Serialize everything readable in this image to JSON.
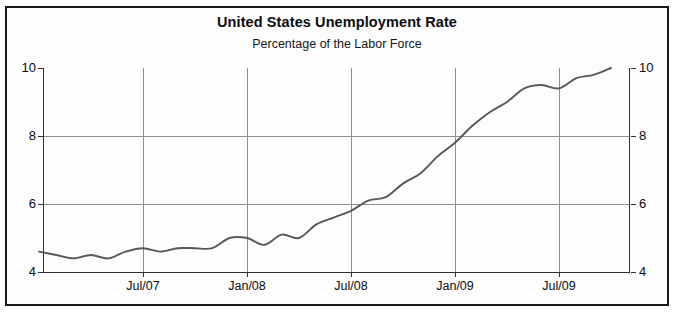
{
  "chart_data": {
    "type": "line",
    "title": "United States Unemployment Rate",
    "subtitle": "Percentage of the Labor Force",
    "xlabel": "",
    "ylabel": "",
    "ylim": [
      4,
      10
    ],
    "yticks": [
      4,
      6,
      8,
      10
    ],
    "ytick_labels": [
      "4",
      "6",
      "8",
      "10"
    ],
    "xtick_labels": [
      "Jul/07",
      "Jan/08",
      "Jul/08",
      "Jan/09",
      "Jul/09"
    ],
    "xlim_labels": [
      "Jan/07",
      "Oct/09"
    ],
    "grid": true,
    "legend": "none",
    "line_color": "#55585c",
    "series": [
      {
        "name": "Unemployment Rate",
        "x": [
          "Jan/07",
          "Feb/07",
          "Mar/07",
          "Apr/07",
          "May/07",
          "Jun/07",
          "Jul/07",
          "Aug/07",
          "Sep/07",
          "Oct/07",
          "Nov/07",
          "Dec/07",
          "Jan/08",
          "Feb/08",
          "Mar/08",
          "Apr/08",
          "May/08",
          "Jun/08",
          "Jul/08",
          "Aug/08",
          "Sep/08",
          "Oct/08",
          "Nov/08",
          "Dec/08",
          "Jan/09",
          "Feb/09",
          "Mar/09",
          "Apr/09",
          "May/09",
          "Jun/09",
          "Jul/09",
          "Aug/09",
          "Sep/09",
          "Oct/09"
        ],
        "values": [
          4.6,
          4.5,
          4.4,
          4.5,
          4.4,
          4.6,
          4.7,
          4.6,
          4.7,
          4.7,
          4.7,
          5.0,
          5.0,
          4.8,
          5.1,
          5.0,
          5.4,
          5.6,
          5.8,
          6.1,
          6.2,
          6.6,
          6.9,
          7.4,
          7.8,
          8.3,
          8.7,
          9.0,
          9.4,
          9.5,
          9.4,
          9.7,
          9.8,
          10.0
        ]
      }
    ]
  },
  "axis": {
    "y_left": [
      "10",
      "8",
      "6",
      "4"
    ],
    "y_right": [
      "10",
      "8",
      "6",
      "4"
    ],
    "x": [
      "Jul/07",
      "Jan/08",
      "Jul/08",
      "Jan/09",
      "Jul/09"
    ]
  }
}
